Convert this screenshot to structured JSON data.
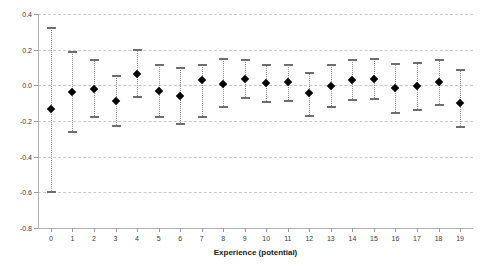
{
  "chart_data": {
    "type": "scatter",
    "title": "",
    "subtitle": "",
    "xlabel": "Experience (potential)",
    "ylabel": "",
    "xlim": [
      -0.6,
      19.6
    ],
    "ylim": [
      -0.8,
      0.4
    ],
    "grid": true,
    "legend": null,
    "y_ticks": [
      "0.4",
      "0.2",
      "0.0",
      "-0.2",
      "-0.4",
      "-0.6",
      "-0.8"
    ],
    "y_tick_values": [
      0.4,
      0.2,
      0.0,
      -0.2,
      -0.4,
      -0.6,
      -0.8
    ],
    "x_ticks": [
      "0",
      "1",
      "2",
      "3",
      "4",
      "5",
      "6",
      "7",
      "8",
      "9",
      "10",
      "11",
      "12",
      "13",
      "14",
      "15",
      "16",
      "17",
      "18",
      "19"
    ],
    "categories": [
      0,
      1,
      2,
      3,
      4,
      5,
      6,
      7,
      8,
      9,
      10,
      11,
      12,
      13,
      14,
      15,
      16,
      17,
      18,
      19
    ],
    "series": [
      {
        "name": "estimate",
        "marker": "filled-diamond",
        "values": [
          -0.135,
          -0.04,
          -0.022,
          -0.089,
          0.065,
          -0.032,
          -0.059,
          0.028,
          0.007,
          0.036,
          0.012,
          0.016,
          -0.043,
          -0.003,
          0.031,
          0.038,
          -0.014,
          -0.004,
          0.018,
          -0.098
        ],
        "upper": [
          0.325,
          0.19,
          0.145,
          0.057,
          0.205,
          0.118,
          0.105,
          0.118,
          0.155,
          0.148,
          0.118,
          0.118,
          0.077,
          0.118,
          0.148,
          0.155,
          0.128,
          0.132,
          0.148,
          0.09
        ],
        "lower": [
          -0.605,
          -0.268,
          -0.186,
          -0.233,
          -0.072,
          -0.182,
          -0.221,
          -0.186,
          -0.128,
          -0.078,
          -0.098,
          -0.092,
          -0.175,
          -0.126,
          -0.088,
          -0.082,
          -0.16,
          -0.142,
          -0.117,
          -0.237
        ]
      }
    ]
  },
  "colors": {
    "marker": "#000000",
    "whisker": "#8c8c8c",
    "cap": "#6e6e6e",
    "gridline": "#c9c9c9",
    "axis": "#b0b0b0",
    "background": "#ffffff",
    "text": "#3a3a3a"
  }
}
